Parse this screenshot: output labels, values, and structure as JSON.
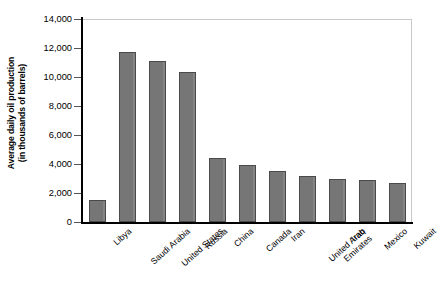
{
  "chart_data": {
    "type": "bar",
    "title": "",
    "xlabel": "",
    "ylabel": "Average daily oil production (in thousands of barrels)",
    "ylabel_line1": "Average daily oil production",
    "ylabel_line2": "(in thousands of barrels)",
    "categories": [
      "Libya",
      "Saudi Arabia",
      "United States",
      "Russia",
      "China",
      "Canada",
      "Iran",
      "United Arab Emirates",
      "Iraq",
      "Mexico",
      "Kuwait"
    ],
    "values": [
      1500,
      11700,
      11100,
      10350,
      4400,
      3900,
      3500,
      3200,
      2950,
      2900,
      2700
    ],
    "ylim": [
      0,
      14000
    ],
    "ytick_values": [
      0,
      2000,
      4000,
      6000,
      8000,
      10000,
      12000,
      14000
    ],
    "ytick_labels": [
      "0",
      "2,000",
      "4,000",
      "6,000",
      "8,000",
      "10,000",
      "12,000",
      "14,000"
    ],
    "grid": false,
    "legend": null,
    "bar_color": "#767676",
    "bar_edge_color": "#4a4a4a",
    "axis_color": "#000000",
    "frame_color": "#c9c9c9",
    "background": "#ffffff"
  }
}
